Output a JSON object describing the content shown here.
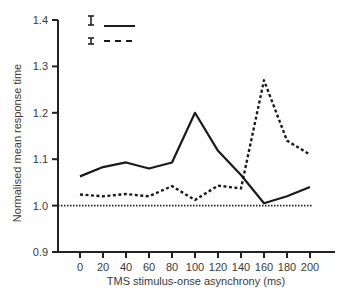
{
  "chart_data": {
    "type": "line",
    "title": "",
    "xlabel": "TMS stimulus-onse asynchrony (ms)",
    "ylabel": "Normalised mean response time",
    "x": [
      0,
      20,
      40,
      60,
      80,
      100,
      120,
      140,
      160,
      180,
      200
    ],
    "xticks": [
      "0",
      "20",
      "40",
      "60",
      "80",
      "100",
      "120",
      "140",
      "160",
      "180",
      "200"
    ],
    "yticks": [
      "0.9",
      "1.0",
      "1.1",
      "1.2",
      "1.3",
      "1.4"
    ],
    "ylim": [
      0.9,
      1.4
    ],
    "grid": false,
    "baseline": {
      "value": 1.0,
      "style": "dotted"
    },
    "legend": {
      "position": "top-left",
      "entries": [
        {
          "marker": "error-bar",
          "line": "solid",
          "label": ""
        },
        {
          "marker": "error-bar",
          "line": "dashed",
          "label": ""
        }
      ]
    },
    "series": [
      {
        "name": "solid",
        "style": "solid",
        "values": [
          1.063,
          1.083,
          1.093,
          1.08,
          1.093,
          1.2,
          1.118,
          1.066,
          1.005,
          1.02,
          1.04
        ]
      },
      {
        "name": "dashed",
        "style": "dashed",
        "values": [
          1.024,
          1.02,
          1.025,
          1.02,
          1.042,
          1.012,
          1.043,
          1.037,
          1.27,
          1.14,
          1.11
        ]
      }
    ],
    "colors": {
      "axis": "#222222",
      "solid": "#1a1a1a",
      "dashed": "#1a1a1a",
      "text": "#3a3a3a"
    }
  }
}
